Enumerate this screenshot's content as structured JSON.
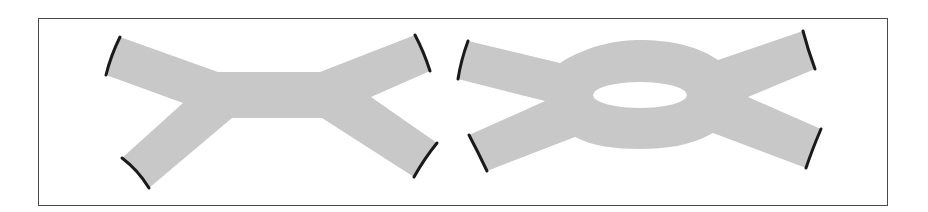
{
  "figure": {
    "colors": {
      "band_fill": "#c8c8c8",
      "cap_stroke": "#1a1a1a",
      "frame_border": "#4a4a4a",
      "background": "#ffffff"
    },
    "panels": [
      {
        "id": "left",
        "label": "",
        "shape": "H-shaped band: four arms joined by a straight central bar",
        "arm_count": 4,
        "has_hole": false
      },
      {
        "id": "right",
        "label": "",
        "shape": "Four arms joined by an annular ring with an elliptical hole",
        "arm_count": 4,
        "has_hole": true
      }
    ]
  }
}
